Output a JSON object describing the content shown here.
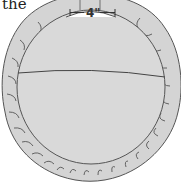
{
  "caption": {
    "text": "the"
  },
  "illustration": {
    "subject": "round ruffled cushion",
    "measurement_label": "4\"",
    "colors": {
      "fill": "#d9d9d9",
      "ruffle": "#d4d4d4",
      "stroke": "#555555"
    }
  }
}
